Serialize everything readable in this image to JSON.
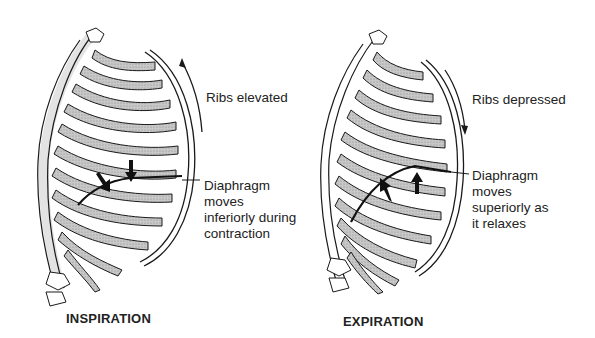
{
  "panels": [
    {
      "id": "inspiration",
      "caption": "INSPIRATION",
      "rib_label": "Ribs elevated",
      "rib_arrow_direction": "up",
      "diaphragm_label": [
        "Diaphragm",
        "moves",
        "inferiorly during",
        "contraction"
      ],
      "diaphragm_arrow_direction": "down"
    },
    {
      "id": "expiration",
      "caption": "EXPIRATION",
      "rib_label": "Ribs depressed",
      "rib_arrow_direction": "down",
      "diaphragm_label": [
        "Diaphragm",
        "moves",
        "superiorly as",
        "it relaxes"
      ],
      "diaphragm_arrow_direction": "up"
    }
  ],
  "colors": {
    "line": "#1a1a1a",
    "rib_fill": "#bdbdbd",
    "background": "#ffffff"
  }
}
